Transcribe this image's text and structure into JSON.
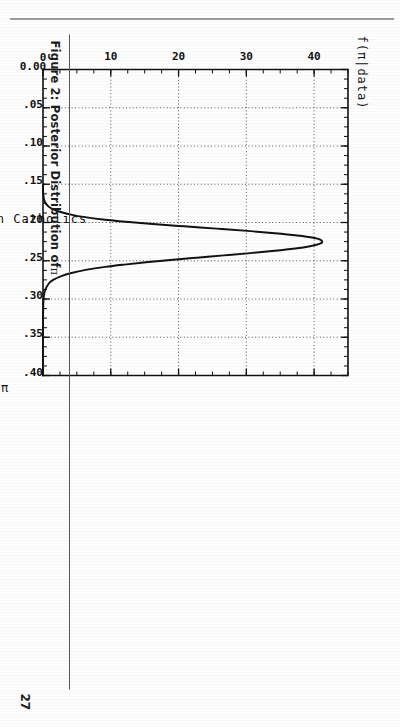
{
  "document": {
    "page_number": "27",
    "caption_prefix": "Figure 2:  Posterior Distribution of",
    "caption_symbol": "π",
    "caption_full": "Figure 2:  Posterior Distribution of π"
  },
  "chart_data": {
    "type": "line",
    "title": "",
    "xlabel": "Proportion Catholics",
    "xlabel_symbol": "π",
    "ylabel": "f(π|data)",
    "xlim": [
      0.0,
      0.4
    ],
    "ylim": [
      0,
      45
    ],
    "grid": true,
    "legend": "none",
    "x_ticks": [
      0.0,
      0.05,
      0.1,
      0.15,
      0.2,
      0.25,
      0.3,
      0.35,
      0.4
    ],
    "x_tick_labels": [
      "0.00",
      ".05",
      ".10",
      ".15",
      ".20",
      ".25",
      ".30",
      ".35",
      ".40"
    ],
    "y_ticks": [
      0,
      10,
      20,
      30,
      40
    ],
    "y_tick_labels": [
      "0",
      "10",
      "20",
      "30",
      "40"
    ],
    "x_minor_tick_step": 0.0125,
    "y_minor_tick_step": 2.5,
    "distribution": "beta-like posterior",
    "peak_x": 0.2255,
    "peak_y": 41.2,
    "x": [
      0.15,
      0.16,
      0.17,
      0.175,
      0.18,
      0.185,
      0.19,
      0.193,
      0.196,
      0.199,
      0.202,
      0.205,
      0.208,
      0.211,
      0.214,
      0.217,
      0.22,
      0.2225,
      0.2255,
      0.228,
      0.231,
      0.234,
      0.237,
      0.24,
      0.243,
      0.246,
      0.249,
      0.252,
      0.255,
      0.258,
      0.262,
      0.266,
      0.27,
      0.275,
      0.28,
      0.29,
      0.3,
      0.32,
      0.34,
      0.4
    ],
    "y": [
      0.0,
      0.02,
      0.15,
      0.4,
      0.95,
      2.1,
      4.3,
      6.2,
      8.8,
      12.2,
      16.2,
      20.8,
      25.6,
      30.2,
      34.2,
      37.5,
      39.9,
      40.9,
      41.2,
      40.8,
      39.4,
      37.2,
      34.2,
      30.6,
      26.7,
      22.7,
      18.8,
      15.2,
      12.0,
      9.2,
      6.3,
      4.2,
      2.7,
      1.5,
      0.82,
      0.26,
      0.08,
      0.01,
      0.0,
      0.0
    ],
    "series": [
      {
        "name": "f(π|data)",
        "values": [
          0.0,
          0.02,
          0.15,
          0.4,
          0.95,
          2.1,
          4.3,
          6.2,
          8.8,
          12.2,
          16.2,
          20.8,
          25.6,
          30.2,
          34.2,
          37.5,
          39.9,
          40.9,
          41.2,
          40.8,
          39.4,
          37.2,
          34.2,
          30.6,
          26.7,
          22.7,
          18.8,
          15.2,
          12.0,
          9.2,
          6.3,
          4.2,
          2.7,
          1.5,
          0.82,
          0.26,
          0.08,
          0.01,
          0.0,
          0.0
        ]
      }
    ]
  },
  "colors": {
    "ink": "#111111",
    "grid": "#555555",
    "paper": "#fefefe"
  }
}
